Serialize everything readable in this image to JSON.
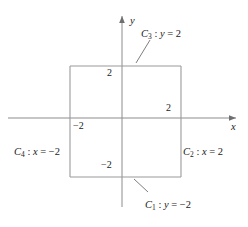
{
  "figure": {
    "type": "coordinate-diagram",
    "background_color": "#ffffff",
    "stroke_color": "#8c8c8c",
    "text_color": "#1a1a1a"
  },
  "axes": {
    "x_label": "x",
    "y_label": "y",
    "origin": {
      "x": 122,
      "y": 118
    },
    "x_range": [
      -2.9,
      2.9
    ],
    "y_range": [
      -2.6,
      3.0
    ]
  },
  "ticks": {
    "y_positive": "2",
    "y_negative": "−2",
    "x_positive": "2",
    "x_negative": "−2"
  },
  "square": {
    "x_min": -2,
    "x_max": 2,
    "y_min": -2,
    "y_max": 2,
    "left_px": 70,
    "top_px": 66,
    "width_px": 111,
    "height_px": 111
  },
  "curves": [
    {
      "id": "C3",
      "name": "C",
      "subscript": "3",
      "separator": " : ",
      "variable": "y",
      "equals": " = ",
      "value": "2",
      "full": "C3 : y = 2",
      "edge": "top",
      "label_x": 141,
      "label_y": 29
    },
    {
      "id": "C2",
      "name": "C",
      "subscript": "2",
      "separator": " : ",
      "variable": "x",
      "equals": " = ",
      "value": "2",
      "full": "C2 : x = 2",
      "edge": "right",
      "label_x": 183,
      "label_y": 147
    },
    {
      "id": "C1",
      "name": "C",
      "subscript": "1",
      "separator": " : ",
      "variable": "y",
      "equals": " = ",
      "value": "−2",
      "full": "C1 : y = -2",
      "edge": "bottom",
      "label_x": 145,
      "label_y": 200
    },
    {
      "id": "C4",
      "name": "C",
      "subscript": "4",
      "separator": " : ",
      "variable": "x",
      "equals": " = ",
      "value": "−2",
      "full": "C4 : x = -2",
      "edge": "left",
      "label_x": 14,
      "label_y": 147
    }
  ]
}
